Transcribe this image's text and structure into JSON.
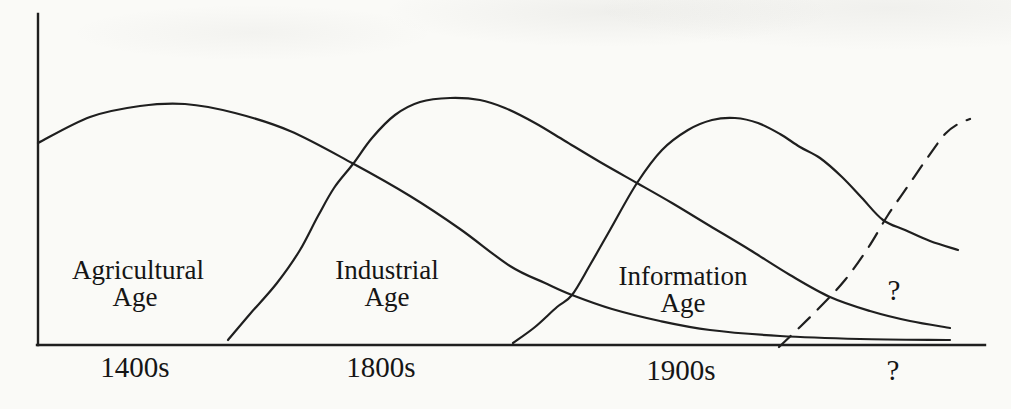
{
  "figure": {
    "background": "#fafaf7",
    "line_color": "#1f1f1f",
    "text_color": "#151515"
  },
  "labels": {
    "agricultural": {
      "line1": "Agricultural",
      "line2": "Age"
    },
    "industrial": {
      "line1": "Industrial",
      "line2": "Age"
    },
    "information": {
      "line1": "Information",
      "line2": "Age"
    },
    "future_question_mark": "?"
  },
  "chart_data": {
    "type": "line",
    "title": "",
    "xlabel": "",
    "ylabel": "",
    "grid": false,
    "legend": "none (labels annotated inside curves)",
    "x_axis": {
      "tick_labels": [
        "1400s",
        "1800s",
        "1900s",
        "?"
      ],
      "tick_x_px": [
        135,
        381,
        681,
        893
      ]
    },
    "annotations": [
      {
        "text": "Agricultural Age",
        "x_px": 138,
        "y_px": 282
      },
      {
        "text": "Industrial Age",
        "x_px": 387,
        "y_px": 284
      },
      {
        "text": "Information Age",
        "x_px": 683,
        "y_px": 290
      },
      {
        "text": "?",
        "x_px": 894,
        "y_px": 291
      }
    ],
    "series": [
      {
        "id": "agricultural",
        "name": "Agricultural Age",
        "style": "solid",
        "peak_x_label": "1400s",
        "points_px": [
          [
            38,
            143
          ],
          [
            90,
            117
          ],
          [
            140,
            106
          ],
          [
            185,
            104
          ],
          [
            235,
            113
          ],
          [
            290,
            131
          ],
          [
            352,
            163
          ],
          [
            410,
            196
          ],
          [
            460,
            229
          ],
          [
            510,
            266
          ],
          [
            545,
            283
          ],
          [
            572,
            295
          ],
          [
            612,
            309
          ],
          [
            660,
            321
          ],
          [
            710,
            330
          ],
          [
            780,
            336
          ],
          [
            860,
            339
          ],
          [
            950,
            340
          ]
        ]
      },
      {
        "id": "industrial",
        "name": "Industrial Age",
        "style": "solid",
        "peak_x_label": "1800s",
        "points_px": [
          [
            228,
            340
          ],
          [
            250,
            314
          ],
          [
            277,
            283
          ],
          [
            300,
            250
          ],
          [
            318,
            216
          ],
          [
            334,
            188
          ],
          [
            353,
            164
          ],
          [
            372,
            138
          ],
          [
            395,
            115
          ],
          [
            420,
            102
          ],
          [
            450,
            98
          ],
          [
            480,
            100
          ],
          [
            505,
            108
          ],
          [
            535,
            123
          ],
          [
            565,
            141
          ],
          [
            600,
            162
          ],
          [
            637,
            183
          ],
          [
            672,
            203
          ],
          [
            710,
            226
          ],
          [
            750,
            250
          ],
          [
            790,
            275
          ],
          [
            830,
            297
          ],
          [
            870,
            311
          ],
          [
            910,
            321
          ],
          [
            950,
            328
          ]
        ]
      },
      {
        "id": "information",
        "name": "Information Age",
        "style": "solid",
        "peak_x_label": "1900s",
        "points_px": [
          [
            513,
            343
          ],
          [
            535,
            327
          ],
          [
            557,
            307
          ],
          [
            572,
            295
          ],
          [
            590,
            265
          ],
          [
            610,
            230
          ],
          [
            637,
            183
          ],
          [
            662,
            150
          ],
          [
            688,
            130
          ],
          [
            712,
            120
          ],
          [
            735,
            118
          ],
          [
            758,
            123
          ],
          [
            780,
            134
          ],
          [
            800,
            147
          ],
          [
            820,
            158
          ],
          [
            842,
            177
          ],
          [
            862,
            198
          ],
          [
            883,
            220
          ],
          [
            905,
            230
          ],
          [
            930,
            241
          ],
          [
            958,
            250
          ]
        ]
      },
      {
        "id": "future",
        "name": "?",
        "style": "dashed",
        "peak_x_label": "?",
        "points_px": [
          [
            779,
            347
          ],
          [
            800,
            327
          ],
          [
            822,
            305
          ],
          [
            845,
            280
          ],
          [
            868,
            248
          ],
          [
            888,
            215
          ],
          [
            908,
            186
          ],
          [
            928,
            157
          ],
          [
            945,
            134
          ],
          [
            958,
            124
          ],
          [
            970,
            119
          ]
        ]
      }
    ]
  }
}
